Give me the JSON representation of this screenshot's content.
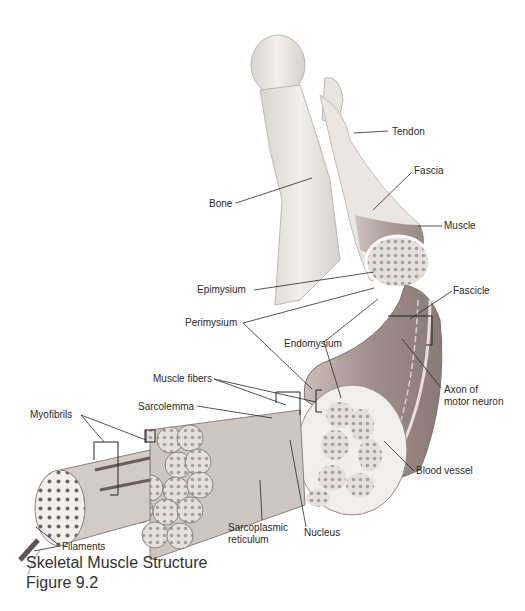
{
  "figure": {
    "title": "Skeletal Muscle Structure",
    "number": "Figure 9.2"
  },
  "labels": {
    "tendon": "Tendon",
    "fascia": "Fascia",
    "bone": "Bone",
    "muscle": "Muscle",
    "epimysium": "Epimysium",
    "fascicle": "Fascicle",
    "perimysium": "Perimysium",
    "endomysium": "Endomysium",
    "muscle_fibers": "Muscle fibers",
    "axon_line1": "Axon of",
    "axon_line2": "motor neuron",
    "myofibrils": "Myofibrils",
    "sarcolemma": "Sarcolemma",
    "blood_vessel": "Blood vessel",
    "sarcoplasmic_line1": "Sarcoplasmic",
    "sarcoplasmic_line2": "reticulum",
    "nucleus": "Nucleus",
    "filaments": "Filaments"
  },
  "colors": {
    "bone": "#ece9e4",
    "muscle": "#b9a8a4",
    "muscle_dark": "#8e7c78",
    "fiber": "#d2c8c4",
    "line": "#333333"
  }
}
